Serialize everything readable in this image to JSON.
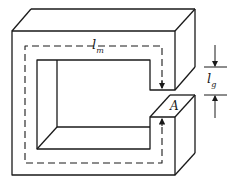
{
  "diagram": {
    "type": "magnetic-core-with-air-gap",
    "labels": {
      "mean_path": {
        "base": "l",
        "sub": "m"
      },
      "gap_length": {
        "base": "l",
        "sub": "g"
      },
      "area": "A"
    },
    "colors": {
      "stroke": "#1a1a1a",
      "background": "#ffffff"
    }
  }
}
